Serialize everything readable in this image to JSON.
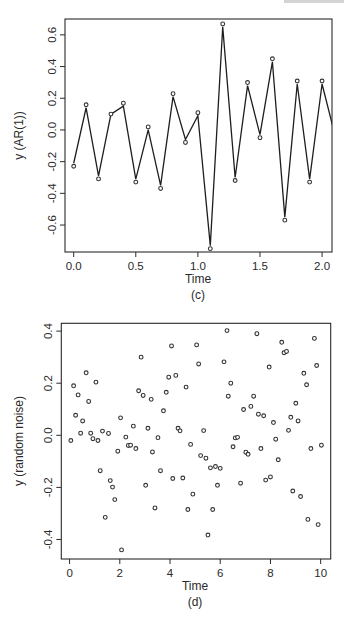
{
  "chart_data": [
    {
      "id": "c",
      "type": "line",
      "caption": "(c)",
      "title": "",
      "xlabel": "Time",
      "ylabel": "y (AR(1))",
      "xlim": [
        -0.07,
        2.08
      ],
      "ylim": [
        -0.77,
        0.7
      ],
      "xticks": [
        0.0,
        0.5,
        1.0,
        1.5,
        2.0
      ],
      "xtick_labels": [
        "0.0",
        "0.5",
        "1.0",
        "1.5",
        "2.0"
      ],
      "yticks": [
        -0.6,
        -0.4,
        -0.2,
        0.0,
        0.2,
        0.4,
        0.6
      ],
      "ytick_labels": [
        "-0.6",
        "-0.4",
        "-0.2",
        "0.0",
        "0.2",
        "0.4",
        "0.6"
      ],
      "grid": false,
      "markers": "open-circle",
      "x": [
        0.0,
        0.1,
        0.2,
        0.3,
        0.4,
        0.5,
        0.6,
        0.7,
        0.8,
        0.9,
        1.0,
        1.1,
        1.2,
        1.3,
        1.4,
        1.5,
        1.6,
        1.7,
        1.8,
        1.9,
        2.0,
        2.1
      ],
      "y": [
        -0.21,
        0.14,
        -0.29,
        0.1,
        0.15,
        -0.31,
        0.0,
        -0.35,
        0.21,
        -0.06,
        0.09,
        -0.73,
        0.65,
        -0.3,
        0.28,
        -0.03,
        0.43,
        -0.55,
        0.29,
        -0.31,
        0.29,
        -0.02
      ]
    },
    {
      "id": "d",
      "type": "scatter",
      "caption": "(d)",
      "title": "",
      "xlabel": "Time",
      "ylabel": "y (random noise)",
      "xlim": [
        -0.33,
        10.4
      ],
      "ylim": [
        -0.475,
        0.43
      ],
      "xticks": [
        0,
        2,
        4,
        6,
        8,
        10
      ],
      "xtick_labels": [
        "0",
        "2",
        "4",
        "6",
        "8",
        "10"
      ],
      "yticks": [
        -0.4,
        -0.2,
        0.0,
        0.2,
        0.4
      ],
      "ytick_labels": [
        "-0.4",
        "-0.2",
        "0.0",
        "0.2",
        "0.4"
      ],
      "grid": false,
      "markers": "open-circle",
      "x": [
        0.05,
        0.16,
        0.24,
        0.34,
        0.44,
        0.52,
        0.66,
        0.76,
        0.84,
        0.93,
        1.05,
        1.13,
        1.22,
        1.31,
        1.42,
        1.55,
        1.62,
        1.71,
        1.8,
        1.92,
        2.03,
        2.07,
        2.24,
        2.34,
        2.43,
        2.54,
        2.64,
        2.75,
        2.85,
        2.93,
        3.03,
        3.12,
        3.25,
        3.3,
        3.4,
        3.52,
        3.62,
        3.74,
        3.85,
        3.95,
        4.06,
        4.11,
        4.23,
        4.32,
        4.4,
        4.51,
        4.64,
        4.71,
        4.82,
        4.91,
        5.06,
        5.14,
        5.22,
        5.34,
        5.43,
        5.51,
        5.61,
        5.7,
        5.81,
        5.89,
        6.0,
        6.15,
        6.27,
        6.32,
        6.42,
        6.51,
        6.6,
        6.69,
        6.81,
        6.93,
        7.02,
        7.11,
        7.22,
        7.33,
        7.46,
        7.52,
        7.62,
        7.73,
        7.81,
        7.95,
        8.0,
        8.12,
        8.21,
        8.31,
        8.45,
        8.54,
        8.64,
        8.72,
        8.81,
        8.89,
        9.01,
        9.1,
        9.2,
        9.33,
        9.44,
        9.49,
        9.61,
        9.75,
        9.84,
        9.9,
        10.03
      ],
      "y": [
        -0.02,
        0.19,
        0.077,
        0.155,
        0.008,
        0.055,
        0.24,
        0.13,
        0.008,
        -0.013,
        0.204,
        -0.02,
        -0.136,
        0.016,
        -0.315,
        0.007,
        -0.174,
        -0.199,
        -0.247,
        -0.061,
        0.067,
        -0.44,
        -0.007,
        -0.039,
        -0.038,
        0.035,
        -0.051,
        0.171,
        0.3,
        0.153,
        -0.192,
        0.027,
        0.138,
        -0.064,
        -0.279,
        -0.009,
        -0.136,
        0.094,
        0.165,
        0.223,
        0.343,
        -0.166,
        0.23,
        0.027,
        0.017,
        -0.164,
        0.185,
        -0.285,
        -0.035,
        -0.226,
        0.347,
        0.274,
        -0.078,
        0.018,
        -0.088,
        -0.383,
        -0.125,
        -0.285,
        -0.12,
        -0.192,
        -0.127,
        0.282,
        0.402,
        0.15,
        0.2,
        -0.044,
        -0.01,
        -0.008,
        -0.184,
        0.099,
        -0.065,
        -0.073,
        0.111,
        0.15,
        0.39,
        0.081,
        -0.051,
        0.075,
        -0.172,
        0.262,
        -0.16,
        0.049,
        -0.015,
        -0.094,
        0.357,
        0.317,
        0.322,
        0.019,
        0.069,
        -0.214,
        0.123,
        0.055,
        -0.235,
        0.238,
        0.194,
        -0.323,
        -0.051,
        0.372,
        0.268,
        -0.343,
        -0.038
      ]
    }
  ]
}
